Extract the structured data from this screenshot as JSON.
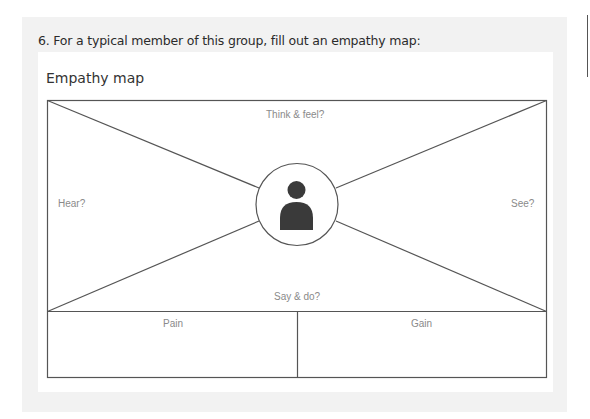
{
  "question": "6. For a typical member of this group, fill out an empathy map:",
  "card": {
    "title": "Empathy map"
  },
  "empathy_map": {
    "think_feel": "Think & feel?",
    "hear": "Hear?",
    "see": "See?",
    "say_do": "Say & do?",
    "pain": "Pain",
    "gain": "Gain",
    "center_icon": "person-icon"
  },
  "colors": {
    "panel_bg": "#f2f2f2",
    "line": "#555555",
    "label": "#8a8a8a",
    "icon": "#3a3a3a"
  }
}
